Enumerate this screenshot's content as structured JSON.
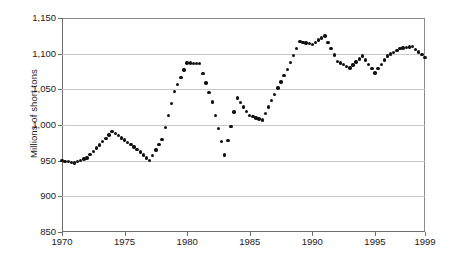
{
  "chart_data": {
    "type": "line",
    "title": "",
    "xlabel": "",
    "ylabel": "Millions of short tons",
    "xlim": [
      1970,
      1999
    ],
    "ylim": [
      850,
      1150
    ],
    "grid": true,
    "legend": "none",
    "marker_style": "dotted",
    "x_tick_labels": [
      "1970",
      "1975",
      "1980",
      "1985",
      "1990",
      "1995",
      "1999"
    ],
    "x_ticks": [
      1970,
      1975,
      1980,
      1985,
      1990,
      1995,
      1999
    ],
    "y_tick_labels": [
      "850",
      "900",
      "950",
      "1,000",
      "1,050",
      "1,100",
      "1,150"
    ],
    "y_ticks": [
      850,
      900,
      950,
      1000,
      1050,
      1100,
      1150
    ],
    "x": [
      1970,
      1971,
      1972,
      1973,
      1974,
      1975,
      1976,
      1977,
      1978,
      1979,
      1980,
      1981,
      1982,
      1983,
      1984,
      1985,
      1986,
      1987,
      1988,
      1989,
      1990,
      1991,
      1992,
      1993,
      1994,
      1995,
      1996,
      1997,
      1998,
      1999
    ],
    "values": [
      950,
      947,
      954,
      972,
      991,
      979,
      966,
      950,
      980,
      1047,
      1087,
      1086,
      1032,
      958,
      1038,
      1013,
      1007,
      1043,
      1078,
      1117,
      1113,
      1125,
      1089,
      1080,
      1097,
      1073,
      1097,
      1107,
      1110,
      1095
    ],
    "series": [
      {
        "name": "Coal production",
        "values": [
          950,
          947,
          954,
          972,
          991,
          979,
          966,
          950,
          980,
          1047,
          1087,
          1086,
          1032,
          958,
          1038,
          1013,
          1007,
          1043,
          1078,
          1117,
          1113,
          1125,
          1089,
          1080,
          1097,
          1073,
          1097,
          1107,
          1110,
          1095
        ]
      }
    ],
    "colors": {
      "marker": "#101010",
      "grid": "#c9c9c9",
      "axis": "#6e6e6e",
      "background": "#ffffff",
      "text": "#1a1a1a"
    }
  }
}
